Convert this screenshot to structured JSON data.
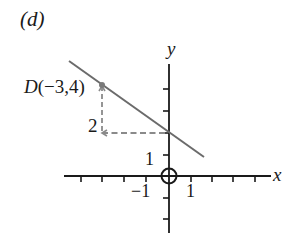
{
  "figure": {
    "panel_label": "(d)",
    "axes": {
      "x_label": "x",
      "y_label": "y",
      "x_tick_labels": {
        "neg1": "−1",
        "pos1": "1"
      },
      "y_tick_labels": {
        "pos1": "1"
      },
      "x_range": [
        -4,
        4
      ],
      "y_range": [
        -2,
        5
      ],
      "grid": false
    },
    "point": {
      "name": "D",
      "coords_text": "(−3,4)",
      "x": -3,
      "y": 4
    },
    "rise_label": "2",
    "line": {
      "description": "line through D(-3,4) and (0,2)",
      "slope": -0.6667,
      "y_intercept": 2
    },
    "colors": {
      "axis": "#1a1a1a",
      "line": "#6b6b6b",
      "dashed": "#8a8a8a",
      "point": "#7a7a7a"
    }
  }
}
